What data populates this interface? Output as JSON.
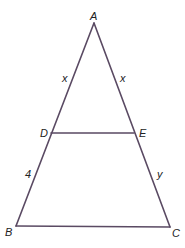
{
  "diagram": {
    "type": "geometry-triangle",
    "line_color": "#5a4a63",
    "vertices": {
      "A": {
        "label": "A"
      },
      "B": {
        "label": "B"
      },
      "C": {
        "label": "C"
      },
      "D": {
        "label": "D"
      },
      "E": {
        "label": "E"
      }
    },
    "segments": [
      {
        "from": "A",
        "to": "B"
      },
      {
        "from": "A",
        "to": "C"
      },
      {
        "from": "B",
        "to": "C"
      },
      {
        "from": "D",
        "to": "E"
      }
    ],
    "side_labels": {
      "AD": "x",
      "AE": "x",
      "DB": "4",
      "EC": "y"
    }
  }
}
